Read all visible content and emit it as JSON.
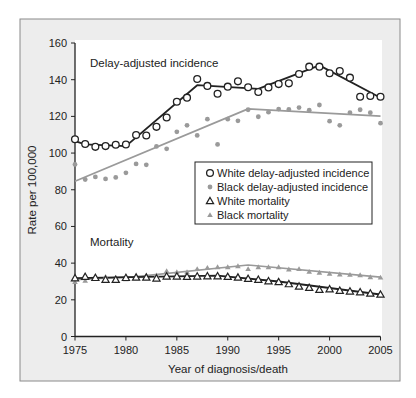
{
  "chart_data": {
    "type": "line",
    "title": "",
    "xlabel": "Year of diagnosis/death",
    "ylabel": "Rate per 100,000",
    "xlim": [
      1975,
      2005
    ],
    "ylim": [
      0,
      160
    ],
    "x_ticks": [
      1975,
      1980,
      1985,
      1990,
      1995,
      2000,
      2005
    ],
    "y_ticks": [
      0,
      20,
      40,
      60,
      80,
      100,
      120,
      140,
      160
    ],
    "grid": false,
    "legend_position": "center-right",
    "annotations": [
      {
        "text": "Delay-adjusted incidence",
        "x": 1977.3,
        "y": 150
      },
      {
        "text": "Mortality",
        "x": 1977.3,
        "y": 52
      }
    ],
    "x": [
      1975,
      1976,
      1977,
      1978,
      1979,
      1980,
      1981,
      1982,
      1983,
      1984,
      1985,
      1986,
      1987,
      1988,
      1989,
      1990,
      1991,
      1992,
      1993,
      1994,
      1995,
      1996,
      1997,
      1998,
      1999,
      2000,
      2001,
      2002,
      2003,
      2004,
      2005
    ],
    "series": [
      {
        "name": "White delay-adjusted incidence",
        "marker": "open-circle",
        "color": "#222222",
        "values": [
          107.5,
          104.9,
          103.4,
          103.8,
          104.5,
          104.7,
          109.8,
          109.6,
          114.3,
          119.4,
          128.0,
          130.2,
          140.4,
          136.6,
          132.3,
          136.2,
          139.1,
          135.9,
          133.3,
          135.8,
          137.6,
          138.0,
          143.1,
          147.1,
          147.1,
          143.5,
          144.7,
          141.1,
          130.7,
          131.1,
          130.7
        ],
        "trend": [
          [
            1975,
            106.5
          ],
          [
            1976,
            104.8
          ],
          [
            1980,
            103.8
          ],
          [
            1987,
            137.0
          ],
          [
            1993,
            135.0
          ],
          [
            1999,
            147.8
          ],
          [
            2005,
            130.2
          ]
        ]
      },
      {
        "name": "Black delay-adjusted incidence",
        "marker": "filled-circle",
        "color": "#9a9a9a",
        "values": [
          93.8,
          85.6,
          87.0,
          85.9,
          86.7,
          89.2,
          94.1,
          93.6,
          103.6,
          102.3,
          111.6,
          115.1,
          109.6,
          118.5,
          104.7,
          118.5,
          117.6,
          123.6,
          119.8,
          122.3,
          124.0,
          123.8,
          124.8,
          123.4,
          126.2,
          117.4,
          115.1,
          122.0,
          123.6,
          122.0,
          116.3
        ],
        "trend": [
          [
            1975,
            84.6
          ],
          [
            1992,
            124.1
          ],
          [
            2005,
            120.1
          ]
        ]
      },
      {
        "name": "White mortality",
        "marker": "open-triangle",
        "color": "#222222",
        "values": [
          31.8,
          32.6,
          32.0,
          31.0,
          31.0,
          32.0,
          32.2,
          32.2,
          31.7,
          32.8,
          32.8,
          32.6,
          32.8,
          32.9,
          32.9,
          32.6,
          32.2,
          31.5,
          31.0,
          30.2,
          29.7,
          28.6,
          27.3,
          26.6,
          25.5,
          25.8,
          25.0,
          24.6,
          24.2,
          23.5,
          22.9
        ],
        "trend": [
          [
            1975,
            31.8
          ],
          [
            1989,
            33.2
          ],
          [
            1995,
            30.0
          ],
          [
            2005,
            22.9
          ]
        ]
      },
      {
        "name": "Black mortality",
        "marker": "filled-triangle",
        "color": "#9a9a9a",
        "values": [
          29.7,
          30.4,
          32.8,
          32.6,
          30.7,
          31.3,
          32.6,
          33.1,
          33.3,
          35.7,
          35.1,
          35.1,
          36.8,
          37.5,
          37.8,
          37.8,
          38.4,
          36.8,
          37.8,
          37.8,
          37.8,
          36.6,
          36.8,
          35.3,
          34.8,
          34.2,
          33.9,
          33.7,
          33.5,
          32.4,
          32.2
        ],
        "trend": [
          [
            1975,
            31.0
          ],
          [
            1981,
            32.6
          ],
          [
            1992,
            39.0
          ],
          [
            2005,
            32.4
          ]
        ]
      }
    ]
  }
}
